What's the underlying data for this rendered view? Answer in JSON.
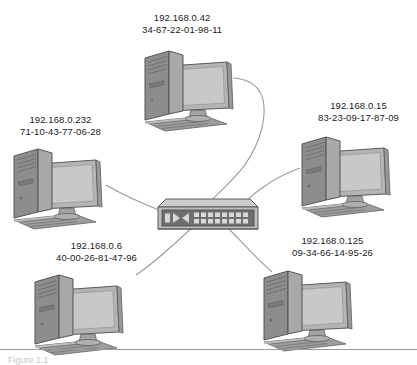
{
  "diagram": {
    "type": "network-topology",
    "topology": "star",
    "title": "",
    "background_color": "#ffffff",
    "cable_color": "#9b9b9b",
    "device_colors": {
      "tower_front": "#8d8d8d",
      "tower_side": "#a8a8a8",
      "monitor_bezel": "#b4b4b4",
      "monitor_screen": "#c6c6c6",
      "keyboard": "#9d9d9d",
      "switch_body": "#b8b8b8",
      "switch_face": "#6f6f6f",
      "outline": "#5a5a5a"
    },
    "center_device": {
      "name": "network-switch",
      "label": "",
      "port_rows": 2,
      "ports_per_row": 8,
      "x": 160,
      "y": 203
    },
    "nodes": [
      {
        "id": "pc-top",
        "ip": "192.168.0.42",
        "mac": "34-67-22-01-98-11",
        "label_x": 142,
        "label_y": 12,
        "pc_x": 143,
        "pc_y": 48
      },
      {
        "id": "pc-left-upper",
        "ip": "192.168.0.232",
        "mac": "71-10-43-77-06-28",
        "label_x": 20,
        "label_y": 114,
        "pc_x": 12,
        "pc_y": 146
      },
      {
        "id": "pc-right-upper",
        "ip": "192.168.0.15",
        "mac": "83-23-09-17-87-09",
        "label_x": 318,
        "label_y": 100,
        "pc_x": 300,
        "pc_y": 134
      },
      {
        "id": "pc-left-lower",
        "ip": "192.168.0.6",
        "mac": "40-00-26-81-47-96",
        "label_x": 56,
        "label_y": 240,
        "pc_x": 33,
        "pc_y": 272
      },
      {
        "id": "pc-right-lower",
        "ip": "192.168.0.125",
        "mac": "09-34-66-14-95-26",
        "label_x": 292,
        "label_y": 235,
        "pc_x": 262,
        "pc_y": 268
      }
    ],
    "connections": [
      {
        "from": "pc-top",
        "to": "network-switch"
      },
      {
        "from": "pc-left-upper",
        "to": "network-switch"
      },
      {
        "from": "pc-right-upper",
        "to": "network-switch"
      },
      {
        "from": "pc-left-lower",
        "to": "network-switch"
      },
      {
        "from": "pc-right-lower",
        "to": "network-switch"
      }
    ]
  },
  "footer": {
    "caption": "Figure 1.1"
  }
}
